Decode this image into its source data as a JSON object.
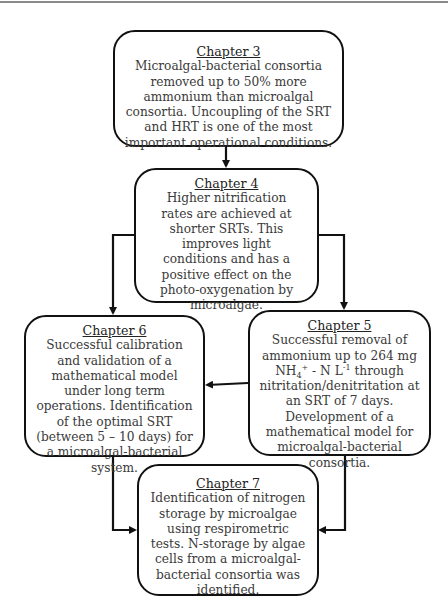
{
  "diagram": {
    "type": "flowchart",
    "nodes": [
      {
        "id": "ch3",
        "title": "Chapter 3",
        "text": "Microalgal-bacterial consortia removed up to 50% more ammonium than microalgal consortia. Uncoupling of the SRT and HRT is one of the most important operational conditions."
      },
      {
        "id": "ch4",
        "title": "Chapter 4",
        "text": "Higher nitrification rates are achieved at shorter SRTs. This improves light conditions and has a positive effect on the photo-oxygenation by microalgae."
      },
      {
        "id": "ch6",
        "title": "Chapter 6",
        "text": "Successful calibration and validation of a mathematical model under long term operations. Identification of the optimal SRT (between 5 – 10 days) for a microalgal-bacterial system."
      },
      {
        "id": "ch5",
        "title": "Chapter 5",
        "text_pre": "Successful removal of ammonium up to 264 mg NH",
        "text_sub": "4",
        "text_sup": "+",
        "text_mid": " - N L",
        "text_sup2": "-1",
        "text_post": " through nitritation/denitritation at an SRT of 7 days. Development of a mathematical model for microalgal-bacterial consortia."
      },
      {
        "id": "ch7",
        "title": "Chapter 7",
        "text": "Identification of nitrogen storage by microalgae using respirometric tests. N-storage by algae cells from a microalgal-bacterial consortia was identified."
      }
    ],
    "edges": [
      {
        "from": "ch3",
        "to": "ch4"
      },
      {
        "from": "ch4",
        "to": "ch6"
      },
      {
        "from": "ch4",
        "to": "ch5"
      },
      {
        "from": "ch5",
        "to": "ch6"
      },
      {
        "from": "ch6",
        "to": "ch7"
      },
      {
        "from": "ch5",
        "to": "ch7"
      }
    ],
    "colors": {
      "border": "#111111",
      "text": "#3a3a3a",
      "rule": "#8a8a8a"
    }
  }
}
